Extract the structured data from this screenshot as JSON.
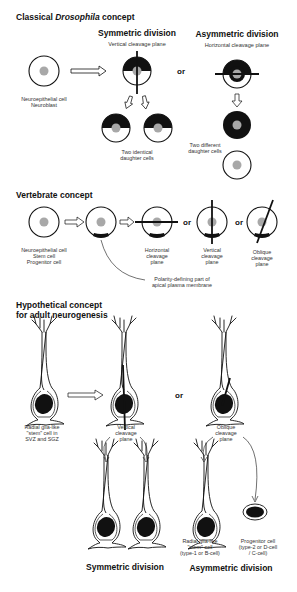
{
  "panel1": {
    "title_prefix": "Classical ",
    "title_italic": "Drosophila",
    "title_suffix": " concept",
    "symmetric": {
      "title": "Symmetric division",
      "subtitle": "Vertical cleavage plane",
      "result": [
        "Two identical",
        "daughter cells"
      ]
    },
    "asymmetric": {
      "title": "Asymmetric division",
      "subtitle": "Horizontal cleavage plane",
      "result": [
        "Two different",
        "daughter cells"
      ]
    },
    "source_label": [
      "Neuroepithelial cell",
      "Neuroblast"
    ],
    "or": "or"
  },
  "panel2": {
    "title": "Vertebrate concept",
    "source_label": [
      "Neuroepithelial cell",
      "Stem cell",
      "Progenitor cell"
    ],
    "horizontal": [
      "Horizontal",
      "cleavage",
      "plane"
    ],
    "vertical": [
      "Vertical",
      "cleavage",
      "plane"
    ],
    "oblique": [
      "Oblique",
      "cleavage",
      "plane"
    ],
    "polarity": [
      "Polarity-defining part of",
      "apical plasma membrane"
    ],
    "or": "or"
  },
  "panel3": {
    "title": [
      "Hypothetical concept",
      "for adult neurogenesis"
    ],
    "source_label": [
      "Radial glia-like",
      "\"stem\" cell in",
      "SVZ and SGZ"
    ],
    "vertical": [
      "Vertical",
      "cleavage",
      "plane"
    ],
    "oblique": [
      "Oblique",
      "cleavage",
      "plane"
    ],
    "stem_label": [
      "Radial glia-like",
      "\"stem\" cell",
      "(type-1 or B-cell)"
    ],
    "progenitor_label": [
      "Progenitor cell",
      "(type-2 or D-cell",
      "/ C-cell)"
    ],
    "symmetric_title": "Symmetric division",
    "asymmetric_title": "Asymmetric division",
    "or": "or"
  },
  "colors": {
    "line": "#111111",
    "nucleus": "#a8a8a8",
    "fill_dark": "#111111",
    "background": "#ffffff"
  }
}
